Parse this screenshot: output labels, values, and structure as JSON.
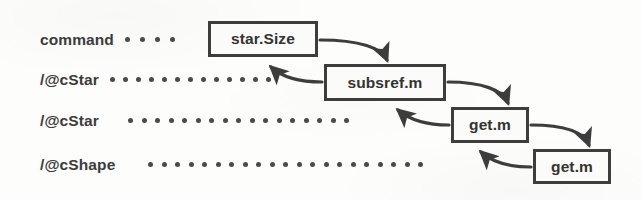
{
  "diagram": {
    "background_color": "#fdfdfb",
    "ink_color": "#3d3d3d",
    "text_color": "#333333",
    "rows": [
      {
        "label": "command",
        "label_x": 40,
        "label_y": 40,
        "dots": 4,
        "dots_x": 125,
        "dots_y": 40,
        "dot_gap": 15
      },
      {
        "label": "/@cStar",
        "label_x": 40,
        "label_y": 80,
        "dots": 13,
        "dots_x": 110,
        "dots_y": 80,
        "dot_gap": 13
      },
      {
        "label": "/@cStar",
        "label_x": 40,
        "label_y": 121,
        "dots": 17,
        "dots_x": 128,
        "dots_y": 121,
        "dot_gap": 13.5
      },
      {
        "label": "/@cShape",
        "label_x": 40,
        "label_y": 165,
        "dots": 21,
        "dots_x": 148,
        "dots_y": 165,
        "dot_gap": 13.5
      }
    ],
    "nodes": [
      {
        "label": "star.Size",
        "x": 208,
        "y": 21,
        "width": 110,
        "height": 36
      },
      {
        "label": "subsref.m",
        "x": 324,
        "y": 64,
        "width": 122,
        "height": 37
      },
      {
        "label": "get.m",
        "x": 451,
        "y": 107,
        "width": 78,
        "height": 36
      },
      {
        "label": "get.m",
        "x": 533,
        "y": 149,
        "width": 78,
        "height": 35
      }
    ],
    "arrows": [
      {
        "kind": "call",
        "from": "star.Size",
        "to": "subsref.m",
        "path": "M 320 40 C 360 40 382 48 387 60"
      },
      {
        "kind": "return",
        "from": "subsref.m",
        "to": "star.Size",
        "path": "M 322 82 C 305 82 285 80 271 67"
      },
      {
        "kind": "call",
        "from": "subsref.m",
        "to": "get.m",
        "path": "M 448 82 C 482 82 503 90 508 103"
      },
      {
        "kind": "return",
        "from": "get.m",
        "to": "subsref.m",
        "path": "M 449 125 C 430 125 412 122 398 110"
      },
      {
        "kind": "call",
        "from": "get.m",
        "to": "get.m-2",
        "path": "M 531 125 C 565 125 584 132 589 145"
      },
      {
        "kind": "return",
        "from": "get.m-2",
        "to": "get.m",
        "path": "M 531 167 C 512 167 494 164 481 152"
      }
    ]
  }
}
